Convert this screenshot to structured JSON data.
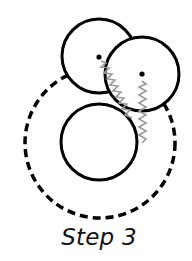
{
  "caption": "Step 3",
  "colors": {
    "stroke": "#000000",
    "spring": "#999999",
    "background": "#ffffff"
  },
  "diagram": {
    "outer_dashed_circle": {
      "cx": 100,
      "cy": 143,
      "r": 75
    },
    "circles": [
      {
        "name": "top-left",
        "cx": 99,
        "cy": 56,
        "r": 37,
        "has_center_dot": true
      },
      {
        "name": "right",
        "cx": 142,
        "cy": 74,
        "r": 37,
        "has_center_dot": true
      },
      {
        "name": "bottom",
        "cx": 99,
        "cy": 142,
        "r": 38,
        "has_center_dot": false
      }
    ],
    "springs": [
      {
        "from": [
          101,
          60
        ],
        "to": [
          132,
          120
        ]
      },
      {
        "from": [
          142,
          80
        ],
        "to": [
          143,
          144
        ]
      }
    ]
  }
}
